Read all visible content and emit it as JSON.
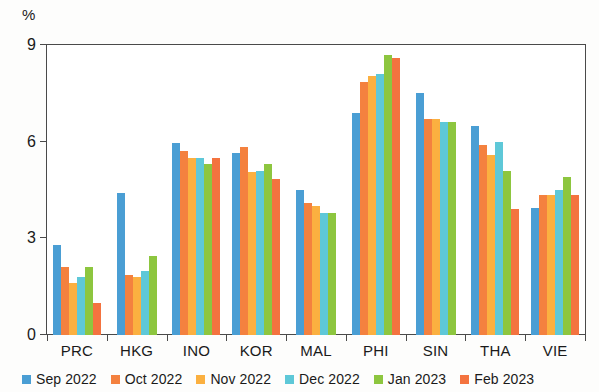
{
  "chart_data": {
    "type": "bar",
    "title": "",
    "subtitle": "",
    "xlabel": "",
    "ylabel": "%",
    "ylim": [
      0,
      9
    ],
    "yticks": [
      0,
      3,
      6,
      9
    ],
    "grid": false,
    "legend_position": "bottom",
    "categories": [
      "PRC",
      "HKG",
      "INO",
      "KOR",
      "MAL",
      "PHI",
      "SIN",
      "THA",
      "VIE"
    ],
    "series": [
      {
        "name": "Sep 2022",
        "color": "#4a9ed4",
        "values": [
          2.8,
          4.4,
          5.95,
          5.65,
          4.5,
          6.9,
          7.5,
          6.5,
          3.95
        ]
      },
      {
        "name": "Oct 2022",
        "color": "#f4813f",
        "values": [
          2.1,
          1.85,
          5.7,
          5.85,
          4.1,
          7.85,
          6.7,
          5.9,
          4.35
        ]
      },
      {
        "name": "Nov 2022",
        "color": "#fbb040",
        "values": [
          1.6,
          1.8,
          5.5,
          5.05,
          4.0,
          8.05,
          6.7,
          5.6,
          4.35
        ]
      },
      {
        "name": "Dec 2022",
        "color": "#5ec8d8",
        "values": [
          1.8,
          2.0,
          5.5,
          5.1,
          3.8,
          8.1,
          6.6,
          6.0,
          4.5
        ]
      },
      {
        "name": "Jan 2023",
        "color": "#8dc63f",
        "values": [
          2.1,
          2.45,
          5.3,
          5.3,
          3.8,
          8.7,
          6.6,
          5.1,
          4.9
        ]
      },
      {
        "name": "Feb 2023",
        "color": "#f4733f",
        "values": [
          1.0,
          null,
          5.5,
          4.85,
          null,
          8.6,
          null,
          3.9,
          4.35
        ]
      }
    ]
  }
}
